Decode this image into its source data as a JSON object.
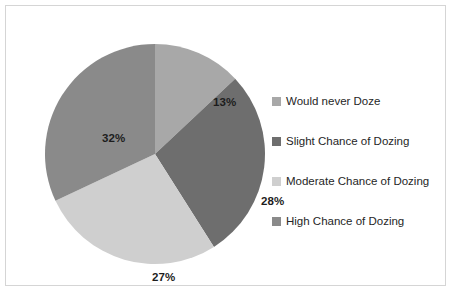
{
  "chart_data": {
    "type": "pie",
    "title": "",
    "categories": [
      "Would never Doze",
      "Slight Chance of Dozing",
      "Moderate Chance of Dozing",
      "High Chance of Dozing"
    ],
    "values": [
      13,
      28,
      27,
      32
    ],
    "value_labels": [
      "13%",
      "28%",
      "27%",
      "32%"
    ],
    "colors": [
      "#a8a8a8",
      "#6e6e6e",
      "#cfcfcf",
      "#8a8a8a"
    ],
    "start_angle_deg": 0,
    "direction": "clockwise",
    "units": "percent",
    "legend_position": "right",
    "grid": false,
    "xlabel": "",
    "ylabel": ""
  },
  "frame": {
    "border_color": "#d5d5d5",
    "background": "#ffffff"
  },
  "legend": {
    "items": [
      {
        "label": "Would never Doze",
        "color": "#a8a8a8"
      },
      {
        "label": "Slight Chance of Dozing",
        "color": "#6e6e6e"
      },
      {
        "label": "Moderate Chance of Dozing",
        "color": "#cfcfcf"
      },
      {
        "label": "High Chance of Dozing",
        "color": "#8a8a8a"
      }
    ]
  }
}
